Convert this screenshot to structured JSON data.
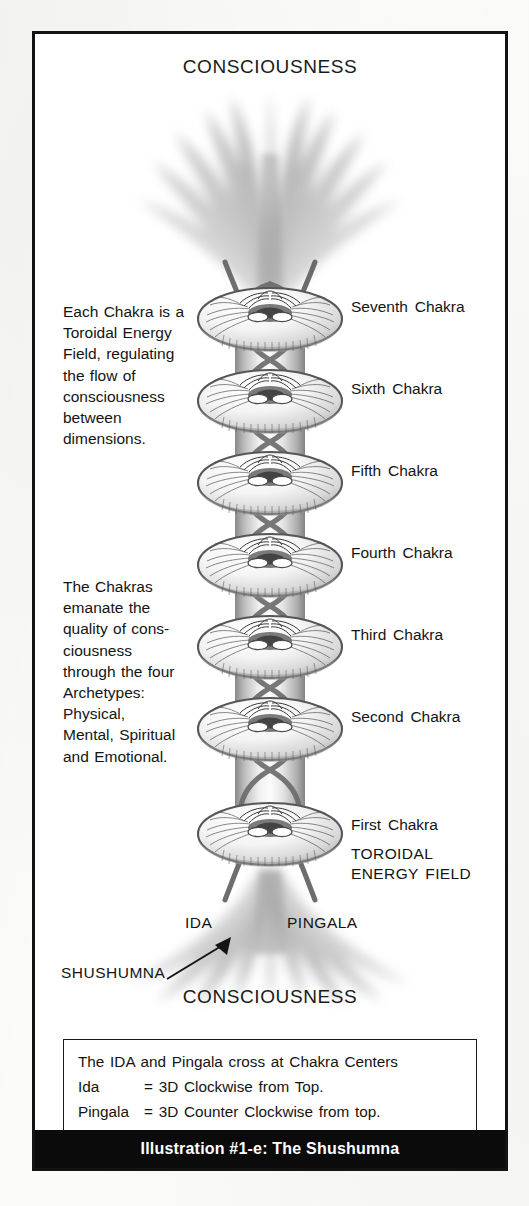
{
  "figure": {
    "heading_top": "CONSCIOUSNESS",
    "heading_bottom": "CONSCIOUSNESS",
    "banner_title": "Illustration #1-e: The Shushumna"
  },
  "paragraphs": {
    "left_top": "Each Chakra is a\nToroidal Energy\nField, regulating\nthe flow of\nconsciousness\nbetween\ndimensions.",
    "left_bottom": "The Chakras\nemanate the\nquality of cons-\nciousness\nthrough the four\nArchetypes:\nPhysical,\nMental, Spiritual\nand Emotional."
  },
  "chakra_labels": [
    {
      "label": "Seventh  Chakra",
      "top": 264
    },
    {
      "label": "Sixth  Chakra",
      "top": 346
    },
    {
      "label": "Fifth  Chakra",
      "top": 428
    },
    {
      "label": "Fourth  Chakra",
      "top": 510
    },
    {
      "label": "Third  Chakra",
      "top": 592
    },
    {
      "label": "Second  Chakra",
      "top": 674
    },
    {
      "label": "First  Chakra",
      "top": 782
    }
  ],
  "callouts": {
    "toroidal_energy_field": "TOROIDAL\nENERGY  FIELD",
    "ida": "IDA",
    "pingala": "PINGALA",
    "shushumna": "SHUSHUMNA"
  },
  "caption": {
    "line1": "The IDA and Pingala cross at Chakra Centers",
    "line2_key": "Ida",
    "line2_val": "= 3D Clockwise from Top.",
    "line3_key": "Pingala",
    "line3_val": "= 3D Counter Clockwise from top."
  },
  "colors": {
    "frame": "#131313",
    "banner_bg": "#0b0b0b",
    "banner_text": "#ffffff",
    "ink": "#141414",
    "torus_line": "#4a4a4a",
    "flare": "#9a9a9a"
  },
  "diagram": {
    "type": "anatomical-energy-diagram",
    "chakra_count": 7,
    "nadi_channels": [
      "Ida",
      "Pingala",
      "Shushumna"
    ],
    "center_x": 235,
    "first_chakra_y": 285,
    "chakra_spacing": 82
  }
}
